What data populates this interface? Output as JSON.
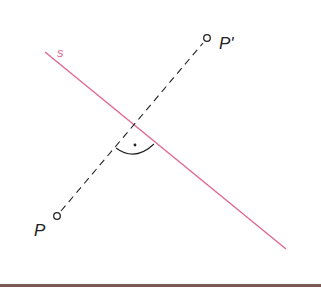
{
  "diagram": {
    "title": "",
    "colors": {
      "mirror_line": "#e0688f",
      "construction": "#222222",
      "background": "#ffffff",
      "bottom_rule": "#7a5a52"
    },
    "mirror_line": {
      "label": "s",
      "from": [
        45,
        52
      ],
      "to": [
        286,
        249
      ]
    },
    "points": [
      {
        "id": "P",
        "label": "P",
        "x": 57,
        "y": 216
      },
      {
        "id": "P_prime",
        "label": "P'",
        "x": 207,
        "y": 38
      }
    ],
    "perpendicular": {
      "style": "dashed",
      "from": "P",
      "to": "P'",
      "intersection": [
        134,
        127
      ]
    },
    "right_angle_marker": {
      "type": "arc-with-dot",
      "dot": [
        135,
        145
      ]
    }
  }
}
